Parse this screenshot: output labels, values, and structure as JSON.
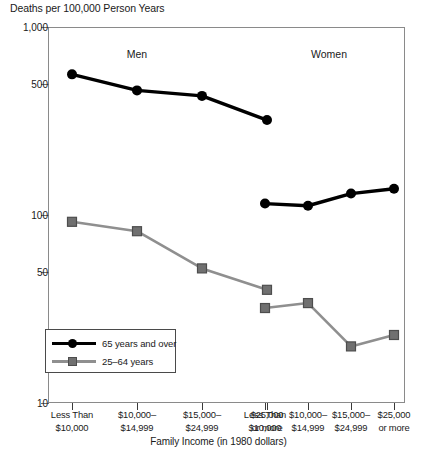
{
  "chart_data": {
    "type": "line",
    "title": "",
    "ylabel": "Deaths per 100,000 Person Years",
    "xlabel": "Family Income (in 1980 dollars)",
    "yscale": "log",
    "ylim": [
      10,
      1000
    ],
    "ytick_labels": [
      "1,000",
      "500",
      "100",
      "50",
      "10"
    ],
    "ytick_values": [
      1000,
      500,
      100,
      50,
      10
    ],
    "grid": false,
    "legend_position": "lower-left",
    "panels": [
      {
        "label": "Men"
      },
      {
        "label": "Women"
      }
    ],
    "categories": [
      "Less Than\n$10,000",
      "$10,000–\n$14,999",
      "$15,000–\n$24,999",
      "$25,000\nor more"
    ],
    "xtick_labels": [
      [
        "Less Than",
        "$10,000"
      ],
      [
        "$10,000–",
        "$14,999"
      ],
      [
        "$15,000–",
        "$24,999"
      ],
      [
        "$25,000",
        "or more"
      ],
      [
        "Less Than",
        "$10,000"
      ],
      [
        "$10,000–",
        "$14,999"
      ],
      [
        "$15,000–",
        "$24,999"
      ],
      [
        "$25,000",
        "or more"
      ]
    ],
    "series": [
      {
        "name": "65 years and over",
        "panel": "Men",
        "marker": "circle",
        "color": "#000000",
        "values": [
          560,
          460,
          430,
          320
        ]
      },
      {
        "name": "25–64 years",
        "panel": "Men",
        "marker": "square",
        "color": "#8f8f8f",
        "values": [
          92,
          82,
          52,
          40
        ]
      },
      {
        "name": "65 years and over",
        "panel": "Women",
        "marker": "circle",
        "color": "#000000",
        "values": [
          115,
          112,
          130,
          138
        ]
      },
      {
        "name": "25–64 years",
        "panel": "Women",
        "marker": "square",
        "color": "#8f8f8f",
        "values": [
          32,
          34,
          20,
          23
        ]
      }
    ]
  },
  "legend": {
    "items": [
      {
        "label": "65 years and over",
        "marker": "circle",
        "color": "#000000"
      },
      {
        "label": "25–64 years",
        "marker": "square",
        "color": "#8f8f8f"
      }
    ]
  }
}
